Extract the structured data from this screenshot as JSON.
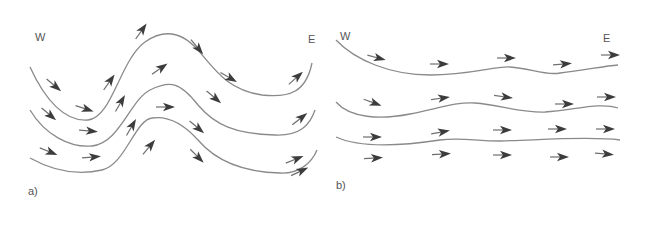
{
  "colors": {
    "background": "#ffffff",
    "streamline": "#8a8a8a",
    "arrow": "#3c3c3c",
    "text": "#555555"
  },
  "panels": [
    {
      "id": "a",
      "label": "a)",
      "west_label": "W",
      "east_label": "E",
      "description": "meridional flow (large-amplitude wave)"
    },
    {
      "id": "b",
      "label": "b)",
      "west_label": "W",
      "east_label": "E",
      "description": "zonal flow (nearly straight west-to-east)"
    }
  ],
  "arrow_icon": "arrow-icon"
}
